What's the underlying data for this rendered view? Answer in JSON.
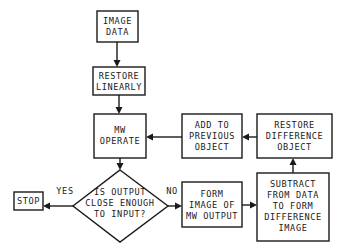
{
  "diagram": {
    "type": "flowchart",
    "nodes": {
      "image_data": {
        "lines": [
          "IMAGE",
          "DATA"
        ]
      },
      "restore_linearly": {
        "lines": [
          "RESTORE",
          "LINEARLY"
        ]
      },
      "mw_operate": {
        "lines": [
          "MW",
          "OPERATE"
        ]
      },
      "add_to_previous": {
        "lines": [
          "ADD TO",
          "PREVIOUS",
          "OBJECT"
        ]
      },
      "restore_difference": {
        "lines": [
          "RESTORE",
          "DIFFERENCE",
          "OBJECT"
        ]
      },
      "decision": {
        "lines": [
          "IS OUTPUT",
          "CLOSE ENOUGH",
          "TO INPUT?"
        ]
      },
      "stop": {
        "lines": [
          "STOP"
        ]
      },
      "form_image": {
        "lines": [
          "FORM",
          "IMAGE OF",
          "MW OUTPUT"
        ]
      },
      "subtract": {
        "lines": [
          "SUBTRACT",
          "FROM DATA",
          "TO FORM",
          "DIFFERENCE",
          "IMAGE"
        ]
      }
    },
    "edge_labels": {
      "yes": "YES",
      "no": "NO"
    },
    "edges": [
      [
        "image_data",
        "restore_linearly"
      ],
      [
        "restore_linearly",
        "mw_operate"
      ],
      [
        "mw_operate",
        "decision"
      ],
      [
        "decision",
        "stop",
        "YES"
      ],
      [
        "decision",
        "form_image",
        "NO"
      ],
      [
        "form_image",
        "subtract"
      ],
      [
        "subtract",
        "restore_difference"
      ],
      [
        "restore_difference",
        "add_to_previous"
      ],
      [
        "add_to_previous",
        "mw_operate"
      ]
    ]
  }
}
